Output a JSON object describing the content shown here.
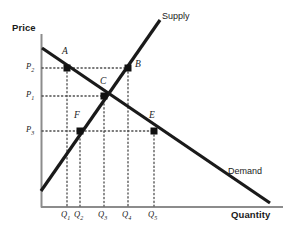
{
  "figure": {
    "kind": "supply-and-demand-diagram",
    "background_color": "#ffffff",
    "line_color": "#1a1a1a",
    "dotted_color": "#4d4d4d",
    "axis_color": "#808080"
  },
  "axes": {
    "y_title": "Price",
    "x_title": "Quantity",
    "origin": {
      "x": 41,
      "y": 207
    },
    "x_end": {
      "x": 283,
      "y": 207
    },
    "y_top": {
      "x": 41,
      "y": 34
    }
  },
  "curves": [
    {
      "name": "supply",
      "label": "Supply",
      "label_pos": {
        "x": 162,
        "y": 12
      },
      "start": {
        "x": 41,
        "y": 191
      },
      "end": {
        "x": 160,
        "y": 20
      },
      "stroke_width": 3.2
    },
    {
      "name": "demand",
      "label": "Demand",
      "label_pos": {
        "x": 228,
        "y": 167
      },
      "start": {
        "x": 42,
        "y": 48
      },
      "end": {
        "x": 270,
        "y": 203
      },
      "stroke_width": 3.2
    }
  ],
  "price_levels": [
    {
      "id": "P2",
      "label": "P",
      "sub": "2",
      "y": 68,
      "label_x": 26,
      "label_y": 62,
      "dash_to_x": 128
    },
    {
      "id": "P1",
      "label": "P",
      "sub": "1",
      "y": 96,
      "label_x": 26,
      "label_y": 90,
      "dash_to_x": 104
    },
    {
      "id": "P3",
      "label": "P",
      "sub": "3",
      "y": 131,
      "label_x": 26,
      "label_y": 125,
      "dash_to_x": 154
    }
  ],
  "quantity_levels": [
    {
      "id": "Q1",
      "label": "Q",
      "sub": "1",
      "x": 67,
      "label_x": 62,
      "label_y": 210,
      "dash_from_y": 68
    },
    {
      "id": "Q2",
      "label": "Q",
      "sub": "2",
      "x": 80,
      "label_x": 75,
      "label_y": 210,
      "dash_from_y": 131
    },
    {
      "id": "Q3",
      "label": "Q",
      "sub": "3",
      "x": 104,
      "label_x": 99,
      "label_y": 210,
      "dash_from_y": 96
    },
    {
      "id": "Q4",
      "label": "Q",
      "sub": "4",
      "x": 128,
      "label_x": 123,
      "label_y": 210,
      "dash_from_y": 68
    },
    {
      "id": "Q5",
      "label": "Q",
      "sub": "5",
      "x": 154,
      "label_x": 149,
      "label_y": 210,
      "dash_from_y": 131
    }
  ],
  "points": [
    {
      "id": "A",
      "label": "A",
      "x": 67,
      "y": 68,
      "label_x": 62,
      "label_y": 52,
      "on": "demand"
    },
    {
      "id": "B",
      "label": "B",
      "x": 128,
      "y": 68,
      "label_x": 134,
      "label_y": 61,
      "on": "supply"
    },
    {
      "id": "C",
      "label": "C",
      "x": 104,
      "y": 96,
      "label_x": 100,
      "label_y": 80,
      "on": "equilibrium"
    },
    {
      "id": "F",
      "label": "F",
      "x": 80,
      "y": 131,
      "label_x": 75,
      "label_y": 115,
      "on": "supply"
    },
    {
      "id": "E",
      "label": "E",
      "x": 154,
      "y": 131,
      "label_x": 150,
      "label_y": 115,
      "on": "demand"
    }
  ]
}
